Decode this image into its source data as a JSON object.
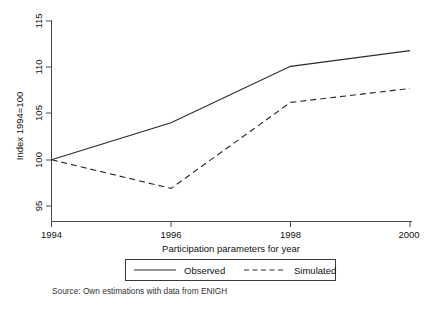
{
  "chart_data": {
    "type": "line",
    "title": "",
    "subtitle": "",
    "xlabel": "Participation parameters for year",
    "ylabel": "Index 1994=100",
    "x": [
      1994,
      1996,
      1998,
      2000
    ],
    "xlim": [
      1994,
      2000
    ],
    "ylim": [
      95,
      115
    ],
    "xticks": [
      1994,
      1996,
      1998,
      2000
    ],
    "yticks": [
      95,
      100,
      105,
      110,
      115
    ],
    "xtick_labels": [
      "1994",
      "1996",
      "1998",
      "2000"
    ],
    "ytick_labels": [
      "95",
      "100",
      "105",
      "110",
      "115"
    ],
    "grid": false,
    "legend_position": "bottom-center",
    "series": [
      {
        "name": "Observed",
        "style": "solid",
        "color": "#2b2b2b",
        "values": [
          100.0,
          104.0,
          110.1,
          111.8
        ]
      },
      {
        "name": "Simulated",
        "style": "dashed",
        "color": "#2b2b2b",
        "values": [
          100.0,
          96.9,
          106.2,
          107.7
        ]
      }
    ],
    "annotations": [
      "Source: Own estimations with data from ENIGH"
    ]
  },
  "legend": {
    "entries": [
      {
        "label": "Observed",
        "style": "solid"
      },
      {
        "label": "Simulated",
        "style": "dashed"
      }
    ]
  },
  "source": {
    "text": "Source: Own estimations with data from ENIGH"
  }
}
